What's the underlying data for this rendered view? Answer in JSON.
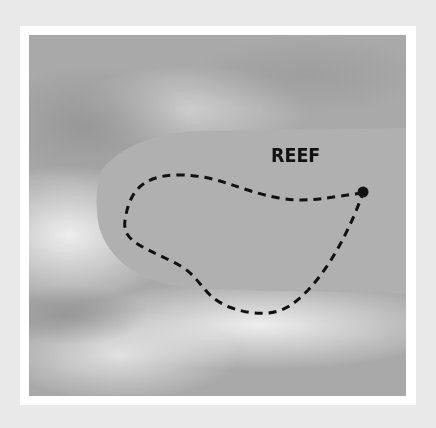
{
  "diagram": {
    "label": "REEF",
    "colors": {
      "page_background": "#e9e9e9",
      "frame": "#ffffff",
      "water_dark": "#9e9e9e",
      "water_light": "#e6e6e6",
      "reef": "#acacac",
      "path": "#111111"
    },
    "elements": [
      {
        "type": "region",
        "name": "reef"
      },
      {
        "type": "dashed-path",
        "name": "route-loop"
      },
      {
        "type": "point",
        "name": "start-point"
      }
    ]
  }
}
